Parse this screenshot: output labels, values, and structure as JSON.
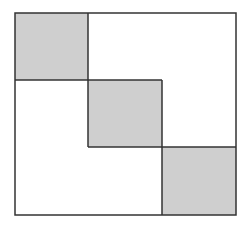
{
  "diagram": {
    "canvas": {
      "width": 248,
      "height": 230,
      "background": "#ffffff"
    },
    "outer_box": {
      "x": 15,
      "y": 13,
      "width": 221,
      "height": 202
    },
    "stroke_color": "#333333",
    "fill_color": "#cfcfcf",
    "blocks": [
      {
        "id": "block-1",
        "x": 15,
        "y": 13,
        "width": 73,
        "height": 67,
        "shaded": true
      },
      {
        "id": "block-2",
        "x": 88,
        "y": 80,
        "width": 74,
        "height": 67,
        "shaded": true
      },
      {
        "id": "block-3",
        "x": 162,
        "y": 147,
        "width": 74,
        "height": 68,
        "shaded": true
      }
    ],
    "lines": [
      {
        "id": "v1",
        "x1": 88,
        "y1": 13,
        "x2": 88,
        "y2": 147
      },
      {
        "id": "h1",
        "x1": 15,
        "y1": 80,
        "x2": 162,
        "y2": 80
      },
      {
        "id": "v2",
        "x1": 162,
        "y1": 80,
        "x2": 162,
        "y2": 215
      },
      {
        "id": "h2",
        "x1": 88,
        "y1": 147,
        "x2": 236,
        "y2": 147
      }
    ]
  }
}
